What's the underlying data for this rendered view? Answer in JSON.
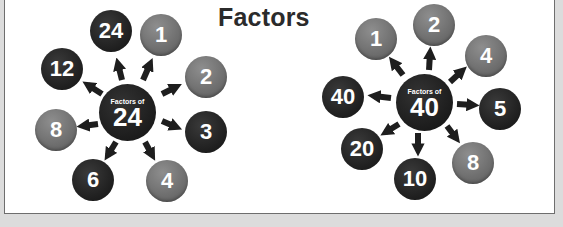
{
  "title": "Factors",
  "colors": {
    "dark": "#1e1e1e",
    "gray": "#707070",
    "background": "#ffffff",
    "border": "#6e6e6e"
  },
  "diagrams": [
    {
      "caption": "Factors of",
      "number": "24",
      "factors": [
        {
          "value": "24",
          "style": "dark"
        },
        {
          "value": "1",
          "style": "gray"
        },
        {
          "value": "2",
          "style": "gray"
        },
        {
          "value": "3",
          "style": "dark"
        },
        {
          "value": "4",
          "style": "gray"
        },
        {
          "value": "6",
          "style": "dark"
        },
        {
          "value": "8",
          "style": "gray"
        },
        {
          "value": "12",
          "style": "dark"
        }
      ]
    },
    {
      "caption": "Factors of",
      "number": "40",
      "factors": [
        {
          "value": "1",
          "style": "gray"
        },
        {
          "value": "2",
          "style": "gray"
        },
        {
          "value": "4",
          "style": "gray"
        },
        {
          "value": "5",
          "style": "dark"
        },
        {
          "value": "8",
          "style": "gray"
        },
        {
          "value": "10",
          "style": "dark"
        },
        {
          "value": "20",
          "style": "dark"
        },
        {
          "value": "40",
          "style": "dark"
        }
      ]
    }
  ]
}
